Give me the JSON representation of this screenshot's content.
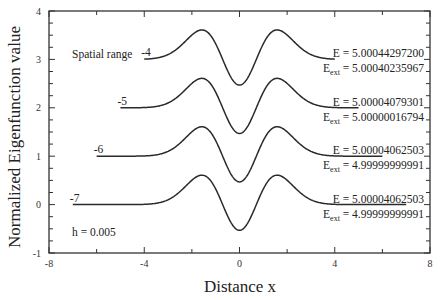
{
  "chart_data": {
    "type": "line",
    "title": "",
    "xlabel": "Distance x",
    "ylabel": "Normalized Eigenfunction value",
    "xlim": [
      -8,
      8
    ],
    "ylim": [
      -1,
      4
    ],
    "x_ticks": [
      -8,
      -4,
      0,
      4,
      8
    ],
    "x_minor_step": 2,
    "y_ticks": [
      -1,
      0,
      1,
      2,
      3,
      4
    ],
    "y_minor_step": 0.25,
    "grid": false,
    "legend": null,
    "note": "Curves offset vertically by 0,1,2,3; shape is harmonic-oscillator n=2 eigenfunction (peaks ~0.61 at x≈±1.58, minimum ~-0.53 at x=0)",
    "series": [
      {
        "name": "Spatial range -4",
        "range_label": "-4",
        "x_range": [
          -4,
          4
        ],
        "offset": 3,
        "E": "5.00044297200",
        "E_ext": "5.00040235967",
        "points": [
          [
            -4,
            3.0
          ],
          [
            -3,
            3.02
          ],
          [
            -2.5,
            3.08
          ],
          [
            -2,
            3.38
          ],
          [
            -1.58,
            3.61
          ],
          [
            -1,
            3.31
          ],
          [
            -0.5,
            2.69
          ],
          [
            0,
            2.47
          ],
          [
            0.5,
            2.69
          ],
          [
            1,
            3.31
          ],
          [
            1.58,
            3.61
          ],
          [
            2,
            3.38
          ],
          [
            2.5,
            3.08
          ],
          [
            3,
            3.02
          ],
          [
            4,
            3.0
          ]
        ]
      },
      {
        "name": "Spatial range -5",
        "range_label": "-5",
        "x_range": [
          -5,
          5
        ],
        "offset": 2,
        "E": "5.00004079301",
        "E_ext": "5.00000016794",
        "points": [
          [
            -5,
            2.0
          ],
          [
            -3,
            2.02
          ],
          [
            -2.5,
            2.08
          ],
          [
            -2,
            2.38
          ],
          [
            -1.58,
            2.61
          ],
          [
            -1,
            2.31
          ],
          [
            -0.5,
            1.69
          ],
          [
            0,
            1.47
          ],
          [
            0.5,
            1.69
          ],
          [
            1,
            2.31
          ],
          [
            1.58,
            2.61
          ],
          [
            2,
            2.38
          ],
          [
            2.5,
            2.08
          ],
          [
            3,
            2.02
          ],
          [
            5,
            2.0
          ]
        ]
      },
      {
        "name": "Spatial range -6",
        "range_label": "-6",
        "x_range": [
          -6,
          6
        ],
        "offset": 1,
        "E": "5.00004062503",
        "E_ext": "4.99999999991",
        "points": [
          [
            -6,
            1.0
          ],
          [
            -3,
            1.02
          ],
          [
            -2.5,
            1.08
          ],
          [
            -2,
            1.38
          ],
          [
            -1.58,
            1.61
          ],
          [
            -1,
            1.31
          ],
          [
            -0.5,
            0.69
          ],
          [
            0,
            0.47
          ],
          [
            0.5,
            0.69
          ],
          [
            1,
            1.31
          ],
          [
            1.58,
            1.61
          ],
          [
            2,
            1.38
          ],
          [
            2.5,
            1.08
          ],
          [
            3,
            1.02
          ],
          [
            6,
            1.0
          ]
        ]
      },
      {
        "name": "Spatial range -7",
        "range_label": "-7",
        "x_range": [
          -7,
          7
        ],
        "offset": 0,
        "E": "5.00004062503",
        "E_ext": "4.99999999991",
        "points": [
          [
            -7,
            0.0
          ],
          [
            -3,
            0.02
          ],
          [
            -2.5,
            0.08
          ],
          [
            -2,
            0.38
          ],
          [
            -1.58,
            0.61
          ],
          [
            -1,
            0.31
          ],
          [
            -0.5,
            -0.31
          ],
          [
            0,
            -0.53
          ],
          [
            0.5,
            -0.31
          ],
          [
            1,
            0.31
          ],
          [
            1.58,
            0.61
          ],
          [
            2,
            0.38
          ],
          [
            2.5,
            0.08
          ],
          [
            3,
            0.02
          ],
          [
            7,
            0.0
          ]
        ]
      }
    ],
    "annotations": {
      "spatial_range_label": "Spatial range",
      "step_size": "h = 0.005"
    }
  },
  "labels": {
    "x_axis_title": "Distance x",
    "y_axis_title": "Normalized Eigenfunction value",
    "spatial_range": "Spatial range",
    "step_size": "h = 0.005",
    "E_prefix": "E = ",
    "E_ext_main": "E",
    "E_ext_sub": "ext",
    "E_ext_eq": " = ",
    "x_tick_labels": [
      "-8",
      "-4",
      "0",
      "4",
      "8"
    ],
    "y_tick_labels": [
      "-1",
      "0",
      "1",
      "2",
      "3",
      "4"
    ]
  }
}
